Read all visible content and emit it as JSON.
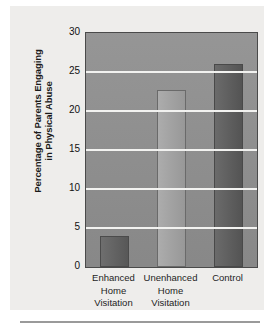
{
  "chart_data": {
    "type": "bar",
    "title": "",
    "xlabel": "",
    "ylabel": "Percentage of Parents Engaging\nin Physical Abuse",
    "categories": [
      "Enhanced\nHome\nVisitation",
      "Unenhanced\nHome\nVisitation",
      "Control"
    ],
    "values": [
      4,
      22.7,
      26
    ],
    "ylim": [
      0,
      30
    ],
    "ytick_labels": [
      "0",
      "5",
      "10",
      "15",
      "20",
      "25",
      "30"
    ],
    "ytick_values": [
      0,
      5,
      10,
      15,
      20,
      25,
      30
    ],
    "grid": true,
    "legend": "none",
    "bar_colors": [
      "#5e5e5e",
      "#a3a3a3",
      "#5a5a5a"
    ],
    "plot_background": "#8f8f8f",
    "gridline_color": "#f2f2f0",
    "figure_background": "#eeedeb"
  }
}
